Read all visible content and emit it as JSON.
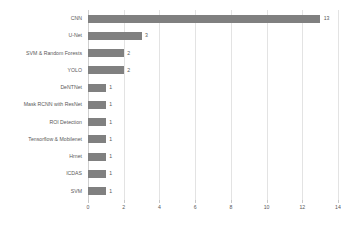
{
  "chart_data": {
    "type": "bar",
    "orientation": "horizontal",
    "title": "",
    "xlabel": "",
    "ylabel": "",
    "xlim": [
      0,
      14
    ],
    "xticks": [
      0,
      2,
      4,
      6,
      8,
      10,
      12,
      14
    ],
    "grid": "vertical",
    "legend": "none",
    "bar_color": "#808080",
    "gridline_color": "#e3e3e3",
    "text_color": "#595959",
    "background": "#ffffff",
    "categories": [
      "CNN",
      "U-Net",
      "SVM & Random Forests",
      "YOLO",
      "DeNTNet",
      "Mask RCNN with ResNet",
      "ROI Detection",
      "Tensorflow & Mobilenet",
      "Hrnet",
      "ICDAS",
      "SVM"
    ],
    "values": [
      13,
      3,
      2,
      2,
      1,
      1,
      1,
      1,
      1,
      1,
      1
    ],
    "data_labels": [
      "13",
      "3",
      "2",
      "2",
      "1",
      "1",
      "1",
      "1",
      "1",
      "1",
      "1"
    ],
    "tick_labels": [
      "0",
      "2",
      "4",
      "6",
      "8",
      "10",
      "12",
      "14"
    ]
  }
}
